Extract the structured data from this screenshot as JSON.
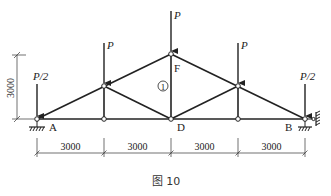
{
  "diagram": {
    "title": "图 10",
    "type": "truss",
    "nodes": {
      "A": "A",
      "B": "B",
      "D": "D",
      "F": "F"
    },
    "member_label": "1",
    "loads": {
      "left_end": "P/2",
      "left_panel": "P",
      "apex": "P",
      "right_panel": "P",
      "right_end": "P/2"
    },
    "dimensions": {
      "height": "3000",
      "spans": [
        "3000",
        "3000",
        "3000",
        "3000"
      ]
    },
    "supports": {
      "A": "pin support",
      "B": "roller with lateral restraint"
    },
    "colors": {
      "line": "#222222",
      "background": "#ffffff"
    }
  }
}
